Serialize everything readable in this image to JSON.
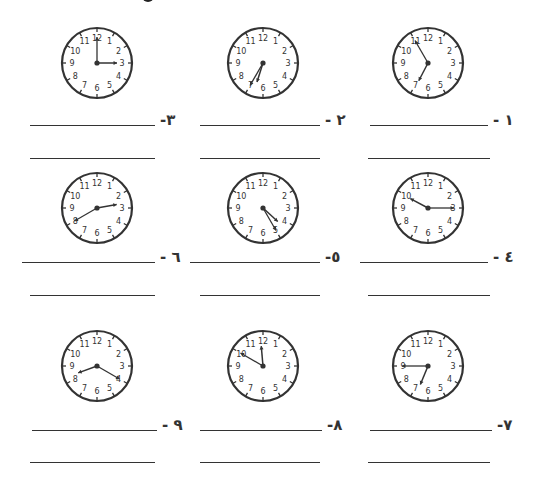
{
  "worksheet": {
    "exercises": [
      {
        "number": "١",
        "label": "١ -",
        "time": "6:55",
        "hour": 6,
        "minute": 55,
        "col": 3,
        "row": 1
      },
      {
        "number": "٢",
        "label": "٢ -",
        "time": "6:35",
        "hour": 6,
        "minute": 35,
        "col": 2,
        "row": 1
      },
      {
        "number": "٣",
        "label": "٣-",
        "time": "3:00",
        "hour": 3,
        "minute": 0,
        "col": 1,
        "row": 1
      },
      {
        "number": "٤",
        "label": "٤ -",
        "time": "10:15",
        "hour": 9,
        "minute": 50,
        "hour_angle_override": 298,
        "minute_hand_at": 3,
        "col": 3,
        "row": 2
      },
      {
        "number": "٥",
        "label": "٥-",
        "time": "4:25",
        "hour": 4,
        "minute": 25,
        "col": 2,
        "row": 2
      },
      {
        "number": "٦",
        "label": "٦ -",
        "time": "2:40",
        "hour": 2,
        "minute": 40,
        "col": 1,
        "row": 2
      },
      {
        "number": "٧",
        "label": "٧-",
        "time": "6:45",
        "hour": 6,
        "minute": 45,
        "col": 3,
        "row": 3
      },
      {
        "number": "٨",
        "label": "٨-",
        "time": "11:50",
        "hour": 11,
        "minute": 50,
        "col": 2,
        "row": 3
      },
      {
        "number": "٩",
        "label": "٩ -",
        "time": "8:20",
        "hour": 8,
        "minute": 20,
        "col": 1,
        "row": 3
      }
    ],
    "clock_face_numbers": [
      "12",
      "1",
      "2",
      "3",
      "4",
      "5",
      "6",
      "7",
      "8",
      "9",
      "10",
      "11"
    ]
  },
  "colors": {
    "ink": "#333333",
    "background": "#ffffff"
  }
}
